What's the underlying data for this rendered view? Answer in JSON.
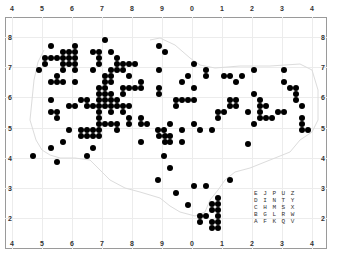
{
  "map": {
    "title": "",
    "x_ticks_top": [
      "4",
      "5",
      "6",
      "7",
      "8",
      "9",
      "0",
      "1",
      "2",
      "3",
      "4"
    ],
    "x_ticks_bottom": [
      "4",
      "5",
      "6",
      "7",
      "8",
      "9",
      "0",
      "1",
      "2",
      "3",
      "4"
    ],
    "y_ticks_left": [
      "8",
      "7",
      "6",
      "5",
      "4",
      "3",
      "2"
    ],
    "y_ticks_right": [
      "8",
      "7",
      "6",
      "5",
      "4",
      "3",
      "2"
    ],
    "dot_color": "#000000",
    "tetrad_legend": [
      "E J P U Z",
      "D I N T Y",
      "C H M S X",
      "B G L R W",
      "A F K Q V"
    ]
  },
  "chart_data": {
    "type": "scatter",
    "xlabel": "Easting (10 km)",
    "ylabel": "Northing (10 km)",
    "grid": true,
    "note": "Points as pixel centers [x,y] in 337x260 frame; 30px = 10 km grid square, 6px = 2 km tetrad",
    "points": [
      [
        51,
        46
      ],
      [
        75,
        46
      ],
      [
        105,
        40
      ],
      [
        159,
        46
      ],
      [
        63,
        52
      ],
      [
        69,
        52
      ],
      [
        75,
        52
      ],
      [
        93,
        52
      ],
      [
        99,
        52
      ],
      [
        111,
        52
      ],
      [
        165,
        52
      ],
      [
        45,
        58
      ],
      [
        51,
        58
      ],
      [
        57,
        58
      ],
      [
        63,
        58
      ],
      [
        69,
        58
      ],
      [
        75,
        58
      ],
      [
        99,
        58
      ],
      [
        117,
        58
      ],
      [
        45,
        64
      ],
      [
        63,
        64
      ],
      [
        69,
        64
      ],
      [
        75,
        64
      ],
      [
        99,
        64
      ],
      [
        117,
        64
      ],
      [
        123,
        64
      ],
      [
        129,
        64
      ],
      [
        135,
        64
      ],
      [
        194,
        64
      ],
      [
        39,
        70
      ],
      [
        63,
        70
      ],
      [
        75,
        70
      ],
      [
        93,
        70
      ],
      [
        111,
        70
      ],
      [
        117,
        70
      ],
      [
        123,
        70
      ],
      [
        159,
        70
      ],
      [
        206,
        70
      ],
      [
        254,
        70
      ],
      [
        284,
        70
      ],
      [
        57,
        76
      ],
      [
        105,
        76
      ],
      [
        111,
        76
      ],
      [
        129,
        76
      ],
      [
        188,
        76
      ],
      [
        206,
        76
      ],
      [
        224,
        76
      ],
      [
        230,
        76
      ],
      [
        242,
        76
      ],
      [
        51,
        82
      ],
      [
        57,
        82
      ],
      [
        63,
        82
      ],
      [
        75,
        82
      ],
      [
        105,
        82
      ],
      [
        111,
        82
      ],
      [
        141,
        82
      ],
      [
        182,
        82
      ],
      [
        236,
        82
      ],
      [
        284,
        82
      ],
      [
        99,
        88
      ],
      [
        105,
        88
      ],
      [
        123,
        88
      ],
      [
        129,
        88
      ],
      [
        135,
        88
      ],
      [
        141,
        88
      ],
      [
        159,
        88
      ],
      [
        194,
        88
      ],
      [
        290,
        88
      ],
      [
        296,
        88
      ],
      [
        99,
        94
      ],
      [
        105,
        94
      ],
      [
        111,
        94
      ],
      [
        123,
        94
      ],
      [
        159,
        94
      ],
      [
        254,
        94
      ],
      [
        296,
        94
      ],
      [
        51,
        100
      ],
      [
        81,
        100
      ],
      [
        87,
        100
      ],
      [
        99,
        100
      ],
      [
        105,
        100
      ],
      [
        111,
        100
      ],
      [
        117,
        100
      ],
      [
        176,
        100
      ],
      [
        182,
        100
      ],
      [
        188,
        100
      ],
      [
        194,
        100
      ],
      [
        230,
        100
      ],
      [
        236,
        100
      ],
      [
        260,
        100
      ],
      [
        296,
        100
      ],
      [
        69,
        106
      ],
      [
        75,
        106
      ],
      [
        87,
        106
      ],
      [
        93,
        106
      ],
      [
        99,
        106
      ],
      [
        105,
        106
      ],
      [
        111,
        106
      ],
      [
        117,
        106
      ],
      [
        123,
        106
      ],
      [
        129,
        106
      ],
      [
        176,
        106
      ],
      [
        230,
        106
      ],
      [
        236,
        106
      ],
      [
        260,
        106
      ],
      [
        266,
        106
      ],
      [
        302,
        106
      ],
      [
        51,
        112
      ],
      [
        57,
        112
      ],
      [
        99,
        112
      ],
      [
        111,
        112
      ],
      [
        123,
        112
      ],
      [
        218,
        112
      ],
      [
        224,
        112
      ],
      [
        248,
        112
      ],
      [
        260,
        112
      ],
      [
        278,
        112
      ],
      [
        284,
        112
      ],
      [
        57,
        118
      ],
      [
        99,
        118
      ],
      [
        129,
        118
      ],
      [
        141,
        118
      ],
      [
        218,
        118
      ],
      [
        260,
        118
      ],
      [
        266,
        118
      ],
      [
        272,
        118
      ],
      [
        302,
        118
      ],
      [
        99,
        124
      ],
      [
        105,
        124
      ],
      [
        111,
        124
      ],
      [
        117,
        124
      ],
      [
        129,
        124
      ],
      [
        141,
        124
      ],
      [
        147,
        124
      ],
      [
        170,
        124
      ],
      [
        194,
        124
      ],
      [
        254,
        124
      ],
      [
        302,
        124
      ],
      [
        69,
        130
      ],
      [
        81,
        130
      ],
      [
        87,
        130
      ],
      [
        93,
        130
      ],
      [
        99,
        130
      ],
      [
        117,
        130
      ],
      [
        158,
        130
      ],
      [
        164,
        130
      ],
      [
        182,
        130
      ],
      [
        200,
        130
      ],
      [
        212,
        130
      ],
      [
        302,
        130
      ],
      [
        308,
        130
      ],
      [
        81,
        136
      ],
      [
        87,
        136
      ],
      [
        93,
        136
      ],
      [
        99,
        136
      ],
      [
        159,
        136
      ],
      [
        165,
        136
      ],
      [
        170,
        136
      ],
      [
        63,
        142
      ],
      [
        141,
        142
      ],
      [
        165,
        142
      ],
      [
        170,
        142
      ],
      [
        182,
        142
      ],
      [
        51,
        148
      ],
      [
        93,
        148
      ],
      [
        248,
        144
      ],
      [
        33,
        156
      ],
      [
        87,
        156
      ],
      [
        164,
        156
      ],
      [
        57,
        162
      ],
      [
        170,
        168
      ],
      [
        158,
        180
      ],
      [
        230,
        180
      ],
      [
        194,
        186
      ],
      [
        206,
        186
      ],
      [
        176,
        193
      ],
      [
        218,
        198
      ],
      [
        188,
        205
      ],
      [
        212,
        204
      ],
      [
        218,
        204
      ],
      [
        212,
        210
      ],
      [
        218,
        210
      ],
      [
        200,
        216
      ],
      [
        206,
        216
      ],
      [
        218,
        216
      ],
      [
        200,
        222
      ],
      [
        212,
        222
      ],
      [
        218,
        222
      ],
      [
        212,
        228
      ],
      [
        218,
        228
      ]
    ]
  }
}
